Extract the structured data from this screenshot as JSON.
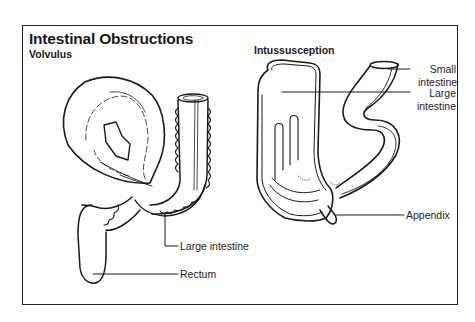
{
  "figure": {
    "title": "Intestinal Obstructions",
    "panels": [
      {
        "heading": "Volvulus",
        "labels": [
          "Large intestine",
          "Rectum"
        ]
      },
      {
        "heading": "Intussusception",
        "labels": [
          "Small intestine",
          "Large intestine",
          "Appendix"
        ]
      }
    ]
  },
  "labels": {
    "volvulus_heading": "Volvulus",
    "intussusception_heading": "Intussusception",
    "left_large_intestine": "Large intestine",
    "rectum": "Rectum",
    "small_intestine_line1": "Small",
    "small_intestine_line2": "intestine",
    "right_large_intestine_line1": "Large",
    "right_large_intestine_line2": "intestine",
    "appendix": "Appendix"
  },
  "colors": {
    "line": "#1a1a1a",
    "background": "#ffffff"
  }
}
